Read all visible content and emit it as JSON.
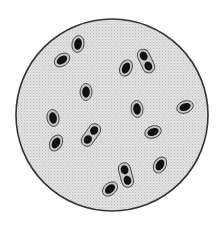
{
  "figure": {
    "colors": {
      "background": "#ffffff",
      "field": "#dcdcdc",
      "field_border": "#333333",
      "capsule": "#c8c8c8",
      "capsule_outline": "#444444",
      "cell": "#111111"
    },
    "cells": [
      {
        "kind": "single",
        "x": 78,
        "y": 44,
        "angle": 10
      },
      {
        "kind": "single",
        "x": 62,
        "y": 60,
        "angle": 55
      },
      {
        "kind": "double",
        "x": 146,
        "y": 61,
        "angle": -25
      },
      {
        "kind": "single",
        "x": 126,
        "y": 68,
        "angle": 25
      },
      {
        "kind": "single",
        "x": 86,
        "y": 92,
        "angle": 0
      },
      {
        "kind": "single",
        "x": 137,
        "y": 109,
        "angle": -5
      },
      {
        "kind": "single",
        "x": 185,
        "y": 107,
        "angle": 70
      },
      {
        "kind": "single",
        "x": 53,
        "y": 118,
        "angle": -10
      },
      {
        "kind": "double",
        "x": 91,
        "y": 135,
        "angle": 35
      },
      {
        "kind": "single",
        "x": 56,
        "y": 143,
        "angle": 30
      },
      {
        "kind": "single",
        "x": 153,
        "y": 132,
        "angle": 70
      },
      {
        "kind": "single",
        "x": 160,
        "y": 165,
        "angle": 30
      },
      {
        "kind": "double",
        "x": 126,
        "y": 175,
        "angle": -15
      },
      {
        "kind": "single",
        "x": 110,
        "y": 189,
        "angle": 50
      }
    ]
  }
}
